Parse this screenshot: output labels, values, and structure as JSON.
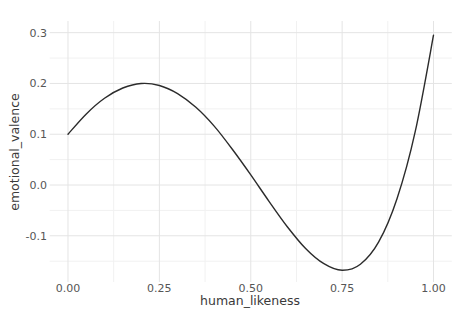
{
  "chart_data": {
    "type": "line",
    "title": "",
    "xlabel": "human_likeness",
    "ylabel": "emotional_valence",
    "xlim": [
      -0.05,
      1.05
    ],
    "ylim": [
      -0.191,
      0.323
    ],
    "x_tick_labels": [
      "0.00",
      "0.25",
      "0.50",
      "0.75",
      "1.00"
    ],
    "x_tick_values": [
      0,
      0.25,
      0.5,
      0.75,
      1.0
    ],
    "y_tick_labels": [
      "0.3",
      "0.2",
      "0.1",
      "0.0",
      "-0.1"
    ],
    "y_tick_values": [
      0.3,
      0.2,
      0.1,
      0.0,
      -0.1
    ],
    "x_minor_ticks": [
      0.125,
      0.375,
      0.625,
      0.875
    ],
    "y_minor_ticks": [
      0.25,
      0.15,
      0.05,
      -0.05,
      -0.15
    ],
    "grid": "major and minor gridlines, no axis lines, no tick marks",
    "legend_position": "none",
    "series": [
      {
        "name": "emotional_valence",
        "x": [
          0.0,
          0.05,
          0.1,
          0.15,
          0.2,
          0.25,
          0.3,
          0.35,
          0.4,
          0.45,
          0.5,
          0.55,
          0.6,
          0.65,
          0.7,
          0.75,
          0.8,
          0.85,
          0.9,
          0.95,
          1.0
        ],
        "y": [
          0.1,
          0.14,
          0.171,
          0.191,
          0.2,
          0.196,
          0.18,
          0.153,
          0.116,
          0.07,
          0.02,
          -0.032,
          -0.082,
          -0.125,
          -0.155,
          -0.168,
          -0.156,
          -0.112,
          -0.027,
          0.105,
          0.295
        ]
      }
    ],
    "key_points": {
      "start": {
        "x": 0.0,
        "y": 0.1
      },
      "local_max": {
        "x": 0.2,
        "y": 0.2
      },
      "local_min": {
        "x": 0.75,
        "y": -0.168
      },
      "end": {
        "x": 1.0,
        "y": 0.295
      }
    },
    "colors": {
      "background": "#ffffff",
      "line": "#2b2b2b",
      "grid_major": "#e4e4e4",
      "grid_minor": "#f1f1f1",
      "tick_text": "#565656",
      "axis_title": "#3a3a3a"
    }
  }
}
